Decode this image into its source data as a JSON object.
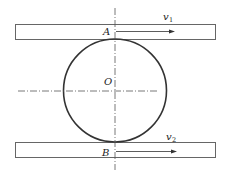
{
  "diagram": {
    "colors": {
      "stroke": "#333333",
      "plate_stroke": "#666666",
      "centerline": "#555555",
      "background": "#ffffff"
    },
    "top_plate": {
      "x": 15,
      "y": 24,
      "width": 200,
      "height": 15
    },
    "bottom_plate": {
      "x": 15,
      "y": 142,
      "width": 200,
      "height": 15
    },
    "circle": {
      "cx": 115,
      "cy": 90.5,
      "r": 51.5
    },
    "labels": {
      "point_top": "A",
      "point_bottom": "B",
      "center": "O",
      "velocity_top": "v",
      "velocity_top_sub": "1",
      "velocity_bottom": "v",
      "velocity_bottom_sub": "2"
    }
  }
}
